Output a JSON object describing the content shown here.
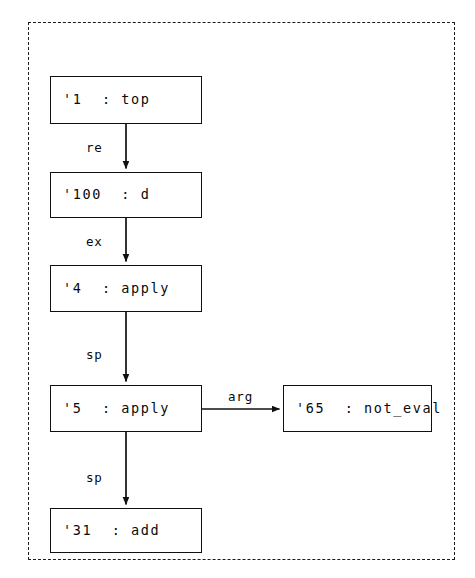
{
  "diagram": {
    "title": "",
    "background_color": "#ffffff",
    "stroke_color": "#101010",
    "cluster": {
      "name": "outer-cluster",
      "border_style": "dashed"
    },
    "nodes": [
      {
        "id": "n1",
        "label": "'1  : top",
        "x": 50,
        "y": 76,
        "w": 152,
        "h": 48
      },
      {
        "id": "n2",
        "label": "'100  : d",
        "x": 50,
        "y": 172,
        "w": 152,
        "h": 46
      },
      {
        "id": "n3",
        "label": "'4  : apply",
        "x": 50,
        "y": 265,
        "w": 152,
        "h": 47
      },
      {
        "id": "n4",
        "label": "'5  : apply",
        "x": 50,
        "y": 385,
        "w": 152,
        "h": 47
      },
      {
        "id": "n5",
        "label": "'31  : add",
        "x": 50,
        "y": 508,
        "w": 152,
        "h": 45
      },
      {
        "id": "n6",
        "label": "'65  : not_eval",
        "x": 283,
        "y": 385,
        "w": 149,
        "h": 47
      }
    ],
    "edges": [
      {
        "id": "e1",
        "from": "n1",
        "to": "n2",
        "label": "re",
        "label_x": 86,
        "label_y": 142
      },
      {
        "id": "e2",
        "from": "n2",
        "to": "n3",
        "label": "ex",
        "label_x": 86,
        "label_y": 236
      },
      {
        "id": "e3",
        "from": "n3",
        "to": "n4",
        "label": "sp",
        "label_x": 86,
        "label_y": 349
      },
      {
        "id": "e4",
        "from": "n4",
        "to": "n6",
        "label": "arg",
        "label_x": 228,
        "label_y": 391
      },
      {
        "id": "e5",
        "from": "n4",
        "to": "n5",
        "label": "sp",
        "label_x": 86,
        "label_y": 472
      }
    ]
  }
}
